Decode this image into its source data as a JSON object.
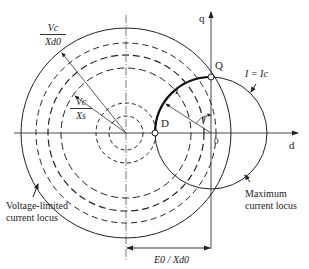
{
  "diagram": {
    "title": "",
    "axes": {
      "d_axis_label": "d",
      "q_axis_label": "q",
      "origin_label": "0"
    },
    "points": {
      "Q": "Q",
      "D": "D"
    },
    "labels": {
      "outer_frac_num": "Vc",
      "outer_frac_den": "Xd0",
      "inner_frac_num": "Vc",
      "inner_frac_den": "Xs",
      "current_I": "I",
      "gamma": "γ",
      "i_equals_ic": "I = Ic",
      "voltage_locus_line1": "Voltage-limited",
      "voltage_locus_line2": "current locus",
      "max_locus_line1": "Maximum",
      "max_locus_line2": "current locus",
      "e0_over_xd0": "E0 / Xd0"
    },
    "colors": {
      "line": "#222222",
      "background": "#ffffff"
    }
  }
}
